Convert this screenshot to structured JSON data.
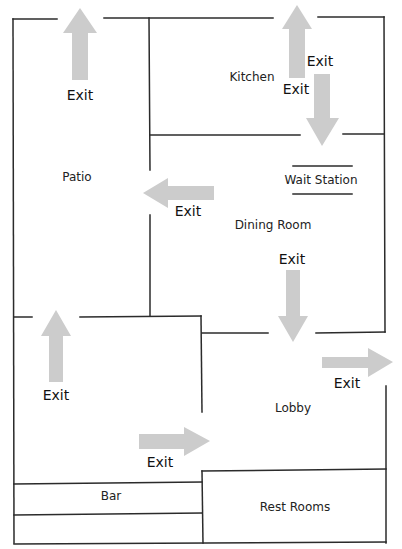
{
  "diagram": {
    "type": "restaurant-floor-plan",
    "colors": {
      "wall": "#2b2b2b",
      "arrow": "#cccccc",
      "text": "#222222",
      "background": "#ffffff"
    },
    "rooms": [
      {
        "id": "kitchen",
        "label": "Kitchen",
        "x": 252,
        "y": 77
      },
      {
        "id": "patio",
        "label": "Patio",
        "x": 77,
        "y": 177
      },
      {
        "id": "wait-station",
        "label": "Wait Station",
        "x": 321,
        "y": 180
      },
      {
        "id": "dining-room",
        "label": "Dining Room",
        "x": 273,
        "y": 225
      },
      {
        "id": "lobby",
        "label": "Lobby",
        "x": 293,
        "y": 408
      },
      {
        "id": "bar",
        "label": "Bar",
        "x": 111,
        "y": 496
      },
      {
        "id": "rest-rooms",
        "label": "Rest Rooms",
        "x": 295,
        "y": 507
      }
    ],
    "exits": [
      {
        "id": "exit-patio-top",
        "label": "Exit",
        "direction": "up",
        "label_x": 80,
        "label_y": 95
      },
      {
        "id": "exit-kitchen-top",
        "label": "Exit",
        "direction": "up",
        "label_x": 320,
        "label_y": 61
      },
      {
        "id": "exit-kitchen-to-dining",
        "label": "Exit",
        "direction": "down",
        "label_x": 296,
        "label_y": 89
      },
      {
        "id": "exit-dining-to-patio",
        "label": "Exit",
        "direction": "left",
        "label_x": 188,
        "label_y": 211
      },
      {
        "id": "exit-dining-to-lobby",
        "label": "Exit",
        "direction": "down",
        "label_x": 292,
        "label_y": 259
      },
      {
        "id": "exit-lobby-right",
        "label": "Exit",
        "direction": "right",
        "label_x": 347,
        "label_y": 383
      },
      {
        "id": "exit-lobby-to-patio",
        "label": "Exit",
        "direction": "up",
        "label_x": 56,
        "label_y": 395
      },
      {
        "id": "exit-lobby-bottom",
        "label": "Exit",
        "direction": "right",
        "label_x": 160,
        "label_y": 462
      }
    ]
  }
}
